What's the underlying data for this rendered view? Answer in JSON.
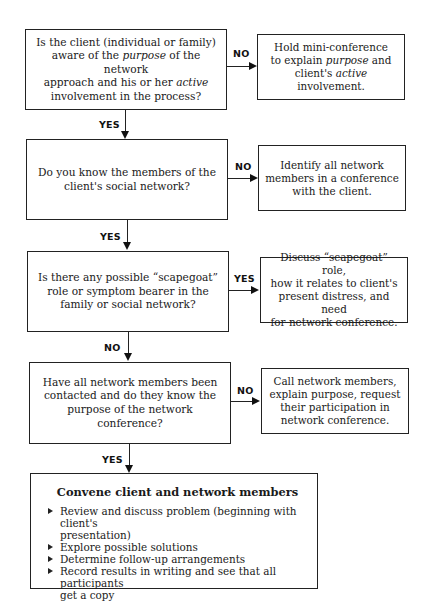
{
  "flowchart": {
    "steps": [
      {
        "question": [
          "Is the client (individual or family)",
          "aware of the ",
          "purpose",
          " of the network",
          "approach and his or her ",
          "active",
          "",
          "involvement in the process?"
        ],
        "question_text": "Is the client (individual or family) aware of the purpose of the network approach and his or her active involvement in the process?",
        "side_label": "NO",
        "side_action_text": "Hold mini-conference to explain purpose and client's active involvement.",
        "down_label": "YES"
      },
      {
        "question_text": "Do you know the members of the client's social network?",
        "side_label": "NO",
        "side_action_text": "Identify all network members in a conference with the client.",
        "down_label": "YES"
      },
      {
        "question_text": "Is there any possible “scapegoat” role or symptom bearer in the family or social network?",
        "side_label": "YES",
        "side_action_text": "Discuss “scapegoat” role, how it relates to client's present distress, and need for network conference.",
        "down_label": "NO"
      },
      {
        "question_text": "Have all network members been contacted and do they know the purpose of the network conference?",
        "side_label": "NO",
        "side_action_text": "Call network members, explain purpose, request their participation in network conference.",
        "down_label": "YES"
      }
    ],
    "q1": {
      "l1": "Is the client (individual or family)",
      "l2a": "aware of the ",
      "l2b": "purpose",
      "l2c": " of the network",
      "l3a": "approach and his or her ",
      "l3b": "active",
      "l4": "involvement in the process?"
    },
    "a1": {
      "l1": "Hold mini-conference",
      "l2a": "to explain ",
      "l2b": "purpose",
      "l2c": " and",
      "l3a": "client's ",
      "l3b": "active",
      "l3c": " involvement."
    },
    "q2": {
      "l1": "Do you know the members of the",
      "l2": "client's social network?"
    },
    "a2": {
      "l1": "Identify all network",
      "l2": "members in a conference",
      "l3": "with the client."
    },
    "q3": {
      "l1": "Is there any possible “scapegoat”",
      "l2": "role or symptom bearer in the",
      "l3": "family or social network?"
    },
    "a3": {
      "l1": "Discuss “scapegoat” role,",
      "l2": "how it relates to client's",
      "l3": "present distress, and need",
      "l4": "for network conference."
    },
    "q4": {
      "l1": "Have all network members been",
      "l2": "contacted and do they know the",
      "l3": "purpose of the network conference?"
    },
    "a4": {
      "l1": "Call network members,",
      "l2": "explain purpose, request",
      "l3": "their participation in",
      "l4": "network conference."
    },
    "labels": {
      "no1": "NO",
      "yes1": "YES",
      "no2": "NO",
      "yes2": "YES",
      "yes3": "YES",
      "no3": "NO",
      "no4": "NO",
      "yes4": "YES"
    },
    "final": {
      "title": "Convene client and network members",
      "items": [
        {
          "l1": "Review and discuss problem (beginning with client's",
          "l2": "presentation)"
        },
        {
          "l1": "Explore possible solutions"
        },
        {
          "l1": "Determine follow-up arrangements"
        },
        {
          "l1": "Record results in writing and see that all participants",
          "l2": "get a copy"
        }
      ]
    }
  }
}
